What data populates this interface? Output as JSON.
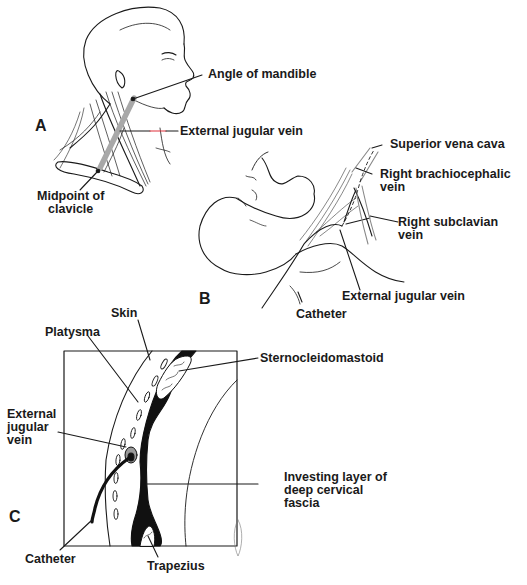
{
  "figure": {
    "panels": [
      {
        "id": "A",
        "letter": "A",
        "labels": {
          "angle_of_mandible": "Angle of mandible",
          "external_jugular_vein": "External jugular vein",
          "midpoint_of_clavicle": "Midpoint of\nclavicle"
        }
      },
      {
        "id": "B",
        "letter": "B",
        "labels": {
          "superior_vena_cava": "Superior vena cava",
          "right_brachiocephalic_vein": "Right brachiocephalic\nvein",
          "right_subclavian_vein": "Right subclavian\nvein",
          "external_jugular_vein": "External jugular vein",
          "catheter": "Catheter"
        }
      },
      {
        "id": "C",
        "letter": "C",
        "labels": {
          "skin": "Skin",
          "platysma": "Platysma",
          "sternocleidomastoid": "Sternocleidomastoid",
          "external_jugular_vein": "External\njugular\nvein",
          "investing_layer": "Investing layer of\ndeep cervical\nfascia",
          "catheter": "Catheter",
          "trapezius": "Trapezius"
        }
      }
    ],
    "colors": {
      "ink": "#1a1a1a",
      "vein_gray": "#a8a8a8",
      "highlight_red": "#e0303a",
      "background": "#ffffff"
    }
  }
}
